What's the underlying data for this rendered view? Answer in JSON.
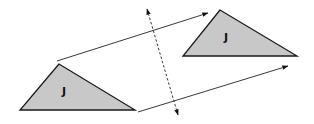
{
  "diagram": {
    "type": "geometric-transformation",
    "colors": {
      "triangle_fill": "#c8c8c8",
      "stroke": "#1a1a1a",
      "background": "#ffffff"
    },
    "shapes": [
      {
        "id": "original-triangle",
        "label": "J",
        "points": [
          [
            59,
            64
          ],
          [
            20,
            110
          ],
          [
            135,
            110
          ]
        ],
        "label_pos": [
          64,
          95
        ]
      },
      {
        "id": "image-triangle",
        "label": "J",
        "points": [
          [
            220,
            10
          ],
          [
            183,
            56
          ],
          [
            297,
            56
          ]
        ],
        "label_pos": [
          226,
          41
        ]
      }
    ],
    "vectors": [
      {
        "id": "upper-translation-arrow",
        "from": [
          57,
          61
        ],
        "to": [
          208,
          13
        ]
      },
      {
        "id": "lower-translation-arrow",
        "from": [
          138,
          112
        ],
        "to": [
          288,
          66
        ]
      }
    ],
    "dashed_line": {
      "id": "dashed-double-arrow",
      "from": [
        147,
        9
      ],
      "to": [
        178,
        115
      ],
      "double_headed": true
    }
  }
}
